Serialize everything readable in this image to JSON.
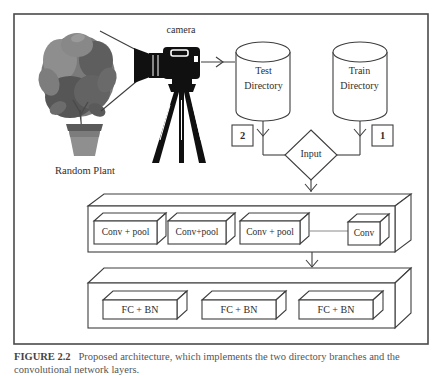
{
  "figure": {
    "caption": {
      "prefix": "FIGURE 2.2",
      "text": "Proposed architecture, which implements the two directory branches and the convolutional network layers."
    }
  },
  "diagram": {
    "labels": {
      "camera": "camera",
      "random_plant": "Random Plant",
      "test_line1": "Test",
      "test_line2": "Directory",
      "train_line1": "Train",
      "train_line2": "Directory",
      "badge_test": "2",
      "badge_train": "1",
      "input": "Input",
      "conv1": "Conv + pool",
      "conv2": "Conv+pool",
      "conv3": "Conv + pool",
      "conv4": "Conv",
      "fc1": "FC + BN",
      "fc2": "FC + BN",
      "fc3": "FC + BN"
    },
    "colors": {
      "line": "#3e3e3e",
      "container_side_gray": "#b5b5b5",
      "box_side_gray": "#bdbdbd",
      "camera_black": "#101010",
      "foliage_gray": "#6f6f6f",
      "pot_gray": "#8f8f8f",
      "white": "#ffffff"
    }
  }
}
